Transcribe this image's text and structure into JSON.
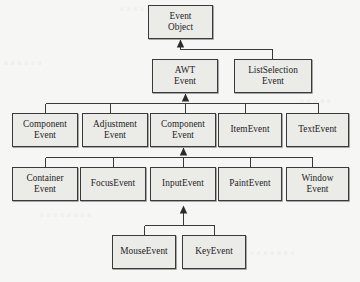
{
  "diagram": {
    "background_color": "#f6f6f4",
    "node_fill_color": "#ebebe8",
    "node_border_color": "#3a3a3a",
    "connector_color": "#3a3a3a",
    "arrow_style": "filled-triangle-up",
    "notation": "inheritance-arrow-points-to-superclass"
  },
  "nodes": [
    {
      "id": "event-object",
      "line1": "Event",
      "line2": "Object",
      "x": 148,
      "y": 5,
      "w": 65,
      "h": 34,
      "level": 1
    },
    {
      "id": "awt-event",
      "line1": "AWT",
      "line2": "Event",
      "x": 152,
      "y": 59,
      "w": 66,
      "h": 34,
      "level": 2
    },
    {
      "id": "listselection-event",
      "line1": "ListSelection",
      "line2": "Event",
      "x": 234,
      "y": 59,
      "w": 78,
      "h": 34,
      "level": 2
    },
    {
      "id": "component-event-a",
      "line1": "Component",
      "line2": "Event",
      "x": 12,
      "y": 113,
      "w": 66,
      "h": 34,
      "level": 3
    },
    {
      "id": "adjustment-event",
      "line1": "Adjustment",
      "line2": "Event",
      "x": 82,
      "y": 113,
      "w": 66,
      "h": 34,
      "level": 3
    },
    {
      "id": "component-event-b",
      "line1": "Component",
      "line2": "Event",
      "x": 150,
      "y": 113,
      "w": 66,
      "h": 34,
      "level": 3
    },
    {
      "id": "item-event",
      "line1": "ItemEvent",
      "line2": "",
      "x": 218,
      "y": 113,
      "w": 64,
      "h": 34,
      "level": 3
    },
    {
      "id": "text-event",
      "line1": "TextEvent",
      "line2": "",
      "x": 286,
      "y": 113,
      "w": 63,
      "h": 34,
      "level": 3
    },
    {
      "id": "container-event",
      "line1": "Container",
      "line2": "Event",
      "x": 12,
      "y": 167,
      "w": 66,
      "h": 34,
      "level": 4
    },
    {
      "id": "focus-event",
      "line1": "FocusEvent",
      "line2": "",
      "x": 80,
      "y": 167,
      "w": 66,
      "h": 34,
      "level": 4
    },
    {
      "id": "input-event",
      "line1": "InputEvent",
      "line2": "",
      "x": 150,
      "y": 167,
      "w": 66,
      "h": 34,
      "level": 4
    },
    {
      "id": "paint-event",
      "line1": "PaintEvent",
      "line2": "",
      "x": 218,
      "y": 167,
      "w": 64,
      "h": 34,
      "level": 4
    },
    {
      "id": "window-event",
      "line1": "Window",
      "line2": "Event",
      "x": 286,
      "y": 167,
      "w": 63,
      "h": 34,
      "level": 4
    },
    {
      "id": "mouse-event",
      "line1": "MouseEvent",
      "line2": "",
      "x": 112,
      "y": 235,
      "w": 64,
      "h": 34,
      "level": 5
    },
    {
      "id": "key-event",
      "line1": "KeyEvent",
      "line2": "",
      "x": 182,
      "y": 235,
      "w": 64,
      "h": 34,
      "level": 5
    }
  ],
  "edges": [
    {
      "from": "awt-event",
      "to": "event-object",
      "kind": "inheritance"
    },
    {
      "from": "listselection-event",
      "to": "event-object",
      "kind": "inheritance"
    },
    {
      "from": "component-event-a",
      "to": "awt-event",
      "kind": "inheritance"
    },
    {
      "from": "adjustment-event",
      "to": "awt-event",
      "kind": "inheritance"
    },
    {
      "from": "component-event-b",
      "to": "awt-event",
      "kind": "inheritance"
    },
    {
      "from": "item-event",
      "to": "awt-event",
      "kind": "inheritance"
    },
    {
      "from": "text-event",
      "to": "awt-event",
      "kind": "inheritance"
    },
    {
      "from": "container-event",
      "to": "component-event-b",
      "kind": "inheritance"
    },
    {
      "from": "focus-event",
      "to": "component-event-b",
      "kind": "inheritance"
    },
    {
      "from": "input-event",
      "to": "component-event-b",
      "kind": "inheritance"
    },
    {
      "from": "paint-event",
      "to": "component-event-b",
      "kind": "inheritance"
    },
    {
      "from": "window-event",
      "to": "component-event-b",
      "kind": "inheritance"
    },
    {
      "from": "mouse-event",
      "to": "input-event",
      "kind": "inheritance"
    },
    {
      "from": "key-event",
      "to": "input-event",
      "kind": "inheritance"
    }
  ],
  "bleed_through_text": [
    {
      "text": "a a a a a a a a a a a",
      "x": 120,
      "y": 4
    },
    {
      "text": "a a a a a a",
      "x": 4,
      "y": 58
    },
    {
      "text": "a a a a a",
      "x": 300,
      "y": 96
    },
    {
      "text": "a a a a a a a a",
      "x": 40,
      "y": 210
    },
    {
      "text": "a a a a a a a",
      "x": 250,
      "y": 248
    }
  ]
}
